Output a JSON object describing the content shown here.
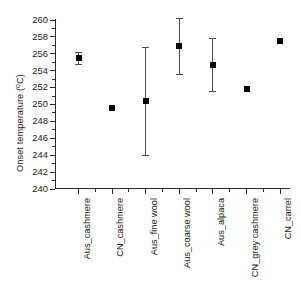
{
  "chart_data": {
    "type": "scatter",
    "title": "",
    "xlabel": "",
    "ylabel": "Onset temperature (°C)",
    "ylabel_text": "Onset temperature (",
    "ylabel_unit": "o",
    "ylabel_tail": "C)",
    "ylim": [
      240,
      260
    ],
    "ytick_step": 2,
    "yticks": [
      260,
      258,
      256,
      254,
      252,
      250,
      248,
      246,
      244,
      242,
      240
    ],
    "ytick_labels": [
      "260",
      "258",
      "256",
      "254",
      "252",
      "250",
      "248",
      "246",
      "244",
      "242",
      "240"
    ],
    "grid": false,
    "legend": "none",
    "categories": [
      "Aus_cashmere",
      "CN_cashmere",
      "Aus_fine wool",
      "Aus_coarse wool",
      "Aus_alpaca",
      "CN_grey cashmere",
      "CN_carrel"
    ],
    "values": [
      255.4,
      249.5,
      250.3,
      256.9,
      254.6,
      251.8,
      257.5
    ],
    "error_low": [
      254.7,
      null,
      244.0,
      253.6,
      251.5,
      null,
      null
    ],
    "error_high": [
      256.2,
      null,
      256.7,
      260.2,
      257.8,
      null,
      null
    ],
    "points": [
      {
        "category": "Aus_cashmere",
        "value": 255.4,
        "low": 254.7,
        "high": 256.2,
        "has_error_bar": true
      },
      {
        "category": "CN_cashmere",
        "value": 249.5,
        "low": null,
        "high": null,
        "has_error_bar": false
      },
      {
        "category": "Aus_fine wool",
        "value": 250.3,
        "low": 244.0,
        "high": 256.7,
        "has_error_bar": true
      },
      {
        "category": "Aus_coarse wool",
        "value": 256.9,
        "low": 253.6,
        "high": 260.2,
        "has_error_bar": true
      },
      {
        "category": "Aus_alpaca",
        "value": 254.6,
        "low": 251.5,
        "high": 257.8,
        "has_error_bar": true
      },
      {
        "category": "CN_grey cashmere",
        "value": 251.8,
        "low": null,
        "high": null,
        "has_error_bar": false
      },
      {
        "category": "CN_carrel",
        "value": 257.5,
        "low": null,
        "high": null,
        "has_error_bar": false
      }
    ],
    "marker_color": "#000000",
    "errorbar_color": "#4a4a4a",
    "axis_color": "#2b2b2b",
    "background_color": "#ffffff"
  }
}
